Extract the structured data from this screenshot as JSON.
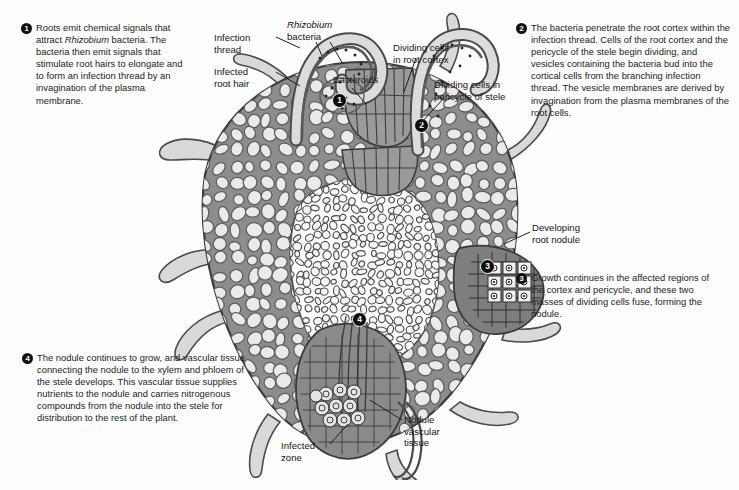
{
  "colors": {
    "cell_wall": "#8d8d8d",
    "cell_fill": "#e9e9e9",
    "stele_fill": "#ffffff",
    "nodule_dark": "#7c7c7c",
    "outline": "#3b3b3b",
    "badge": "#111111",
    "text": "#1a1a1a",
    "background": "#fdfdfd"
  },
  "steps": [
    {
      "number": "1",
      "text_parts": [
        {
          "text": "Roots emit chemical signals that attract ",
          "italic": false
        },
        {
          "text": "Rhizobium",
          "italic": true
        },
        {
          "text": " bacteria. The bacteria then emit signals that stimulate root hairs to elongate and to form an infection thread by an invagination of the plasma membrane.",
          "italic": false
        }
      ],
      "plain": "Roots emit chemical signals that attract Rhizobium bacteria. The bacteria then emit signals that stimulate root hairs to elongate and to form an infection thread by an invagination of the plasma membrane."
    },
    {
      "number": "2",
      "text_parts": [
        {
          "text": "The bacteria penetrate the root cortex within the infection thread. Cells of the root cortex and the pericycle of the stele begin dividing, and vesicles containing the bacteria bud into the cortical cells from the branching infection thread. The vesicle membranes are derived by invagination from the plasma membranes of the root cells.",
          "italic": false
        }
      ],
      "plain": "The bacteria penetrate the root cortex within the infection thread. Cells of the root cortex and the pericycle of the stele begin dividing, and vesicles containing the bacteria bud into the cortical cells from the branching infection thread. The vesicle membranes are derived by invagination from the plasma membranes of the root cells."
    },
    {
      "number": "3",
      "text_parts": [
        {
          "text": "Growth continues in the affected regions of the cortex and pericycle, and these two masses of dividing cells fuse, forming the nodule.",
          "italic": false
        }
      ],
      "plain": "Growth continues in the affected regions of the cortex and pericycle, and these two masses of dividing cells fuse, forming the nodule."
    },
    {
      "number": "4",
      "text_parts": [
        {
          "text": "The nodule continues to grow, and vascular tissue connecting the nodule to the xylem and phloem of the stele develops. This vascular tissue supplies nutrients to the nodule and carries nitrogenous compounds from the nodule into the stele for distribution to the rest of the plant.",
          "italic": false
        }
      ],
      "plain": "The nodule continues to grow, and vascular tissue connecting the nodule to the xylem and phloem of the stele develops. This vascular tissue supplies nutrients to the nodule and carries nitrogenous compounds from the nodule into the stele for distribution to the rest of the plant."
    }
  ],
  "labels": {
    "infection_thread": "Infection\nthread",
    "infected_root_hair": "Infected\nroot hair",
    "rhizobium_line1": "Rhizobium",
    "rhizobium_line2": "bacteria",
    "bacteroids": "Bacteroids",
    "dividing_cells_cortex": "Dividing cells\nin root cortex",
    "dividing_cells_pericycle": "Dividing cells in\npericycle of stele",
    "developing_root_nodule": "Developing\nroot nodule",
    "nodule_vascular_tissue": "Nodule\nvascular\ntissue",
    "infected_zone": "Infected\nzone"
  },
  "diagram_markers": [
    {
      "number": "1",
      "location": "curled infected root hair, upper left of root"
    },
    {
      "number": "2",
      "location": "dividing cells in cortex / infection thread entry, upper center"
    },
    {
      "number": "3",
      "location": "developing root nodule, right side"
    },
    {
      "number": "4",
      "location": "nodule vascular tissue junction with stele, lower center"
    }
  ]
}
